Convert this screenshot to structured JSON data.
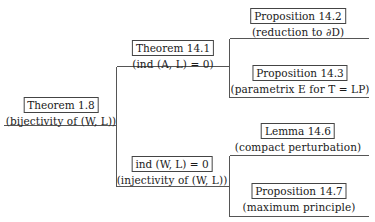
{
  "diagram": {
    "type": "proof-dependency-tree",
    "colors": {
      "line": "#555555",
      "box_border": "#444444",
      "text": "#1a1a1a",
      "background": "#ffffff"
    },
    "root": {
      "title": "Theorem 1.8",
      "subtitle": "(bijectivity of (W, L))"
    },
    "level1": [
      {
        "title": "Theorem 14.1",
        "subtitle": "(ind (A, L) = 0)",
        "children": [
          {
            "title": "Proposition 14.2",
            "subtitle": "(reduction to ∂D)"
          },
          {
            "title": "Proposition 14.3",
            "subtitle": "(parametrix E for T = LP)"
          }
        ]
      },
      {
        "title": "ind (W, L) = 0",
        "subtitle": "(injectivity of (W, L))",
        "children": [
          {
            "title": "Lemma 14.6",
            "subtitle": "(compact perturbation)"
          },
          {
            "title": "Proposition 14.7",
            "subtitle": "(maximum principle)"
          }
        ]
      }
    ]
  }
}
